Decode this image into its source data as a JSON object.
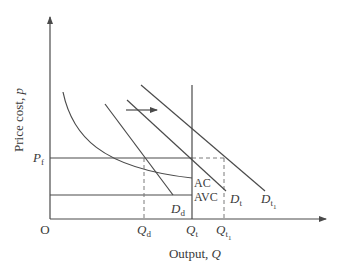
{
  "diagram": {
    "type": "economics-cost-demand",
    "axes": {
      "y_label_text": "Price cost, ",
      "y_label_var": "p",
      "x_label_text": "Output, ",
      "x_label_var": "Q",
      "origin": "O"
    },
    "price_level": {
      "symbol": "P",
      "subscript": "f"
    },
    "quantities": [
      {
        "symbol": "Q",
        "subscript": "d"
      },
      {
        "symbol": "Q",
        "subscript": "t"
      },
      {
        "symbol": "Q",
        "subscript": "t",
        "sub_subscript": "1"
      }
    ],
    "curves": {
      "ac": "AC",
      "avc": "AVC",
      "demand_d": {
        "symbol": "D",
        "subscript": "d"
      },
      "demand_t": {
        "symbol": "D",
        "subscript": "t"
      },
      "demand_t1": {
        "symbol": "D",
        "subscript": "t",
        "sub_subscript": "1"
      }
    },
    "shift_arrow": "right"
  },
  "colors": {
    "line": "#4a4a4a",
    "text": "#3a3a3a",
    "dashed": "#7a7a7a"
  }
}
